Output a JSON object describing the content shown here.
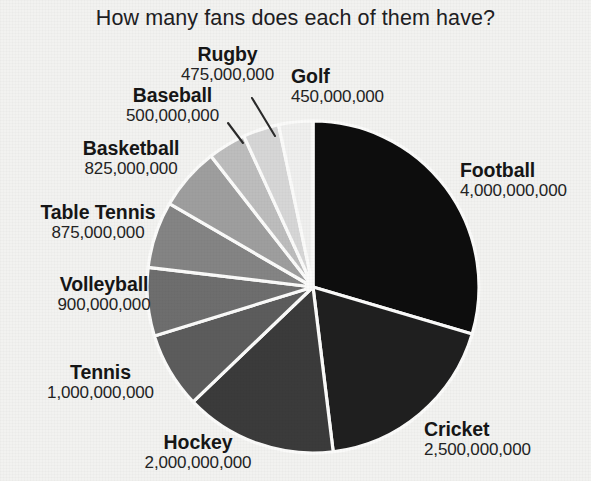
{
  "chart_data": {
    "type": "pie",
    "title": "How many fans does each of them have?",
    "unit": "fans",
    "total": 14425000000,
    "start_angle_deg": 0,
    "direction": "clockwise",
    "legend": "none",
    "labels_position": "outside",
    "categories": [
      "Football",
      "Cricket",
      "Hockey",
      "Tennis",
      "Volleyball",
      "Table Tennis",
      "Basketball",
      "Baseball",
      "Rugby",
      "Golf"
    ],
    "values": [
      4000000000,
      2500000000,
      2000000000,
      1000000000,
      900000000,
      875000000,
      825000000,
      500000000,
      475000000,
      450000000
    ],
    "value_labels": [
      "4,000,000,000",
      "2,500,000,000",
      "2,000,000,000",
      "1,000,000,000",
      "900,000,000",
      "875,000,000",
      "825,000,000",
      "500,000,000",
      "475,000,000",
      "450,000,000"
    ],
    "colors": [
      "#0d0d0d",
      "#1f1f1f",
      "#3b3b3b",
      "#5c5c5c",
      "#6e6e6e",
      "#848484",
      "#9e9e9e",
      "#bdbdbd",
      "#d6d6d6",
      "#efefee"
    ],
    "slices": [
      {
        "name": "Football",
        "value": 4000000000,
        "value_label": "4,000,000,000",
        "color": "#0d0d0d"
      },
      {
        "name": "Cricket",
        "value": 2500000000,
        "value_label": "2,500,000,000",
        "color": "#1f1f1f"
      },
      {
        "name": "Hockey",
        "value": 2000000000,
        "value_label": "2,000,000,000",
        "color": "#3b3b3b"
      },
      {
        "name": "Tennis",
        "value": 1000000000,
        "value_label": "1,000,000,000",
        "color": "#5c5c5c"
      },
      {
        "name": "Volleyball",
        "value": 900000000,
        "value_label": "900,000,000",
        "color": "#6e6e6e"
      },
      {
        "name": "Table Tennis",
        "value": 875000000,
        "value_label": "875,000,000",
        "color": "#848484"
      },
      {
        "name": "Basketball",
        "value": 825000000,
        "value_label": "825,000,000",
        "color": "#9e9e9e"
      },
      {
        "name": "Baseball",
        "value": 500000000,
        "value_label": "500,000,000",
        "color": "#bdbdbd"
      },
      {
        "name": "Rugby",
        "value": 475000000,
        "value_label": "475,000,000",
        "color": "#d6d6d6"
      },
      {
        "name": "Golf",
        "value": 450000000,
        "value_label": "450,000,000",
        "color": "#efefee"
      }
    ]
  },
  "style": {
    "background": "#f2f2f0",
    "slice_border": "#fbfbfa",
    "leader_line": "#2a2a2a",
    "text": "#161616"
  },
  "geometry": {
    "center_x": 313,
    "center_y": 287,
    "radius": 166
  }
}
